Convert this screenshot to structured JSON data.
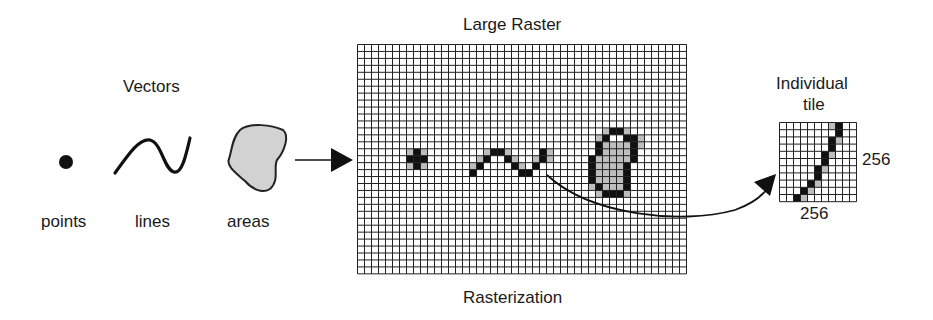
{
  "vectors": {
    "title": "Vectors",
    "items": [
      {
        "label": "points",
        "icon": "point-dot"
      },
      {
        "label": "lines",
        "icon": "wavy-line"
      },
      {
        "label": "areas",
        "icon": "blob-area"
      }
    ]
  },
  "raster": {
    "title": "Large Raster",
    "caption": "Rasterization",
    "columns": 47,
    "rows": 33,
    "black_cells": [
      [
        8,
        15
      ],
      [
        7,
        16
      ],
      [
        8,
        16
      ],
      [
        9,
        16
      ],
      [
        8,
        17
      ],
      [
        16,
        18
      ],
      [
        17,
        17
      ],
      [
        18,
        16
      ],
      [
        19,
        15
      ],
      [
        20,
        15
      ],
      [
        21,
        16
      ],
      [
        22,
        17
      ],
      [
        23,
        18
      ],
      [
        24,
        18
      ],
      [
        25,
        17
      ],
      [
        26,
        16
      ],
      [
        26,
        15
      ],
      [
        36,
        12
      ],
      [
        37,
        12
      ],
      [
        35,
        13
      ],
      [
        38,
        13
      ],
      [
        39,
        13
      ],
      [
        34,
        14
      ],
      [
        39,
        14
      ],
      [
        34,
        15
      ],
      [
        39,
        15
      ],
      [
        33,
        16
      ],
      [
        39,
        16
      ],
      [
        33,
        17
      ],
      [
        38,
        17
      ],
      [
        33,
        18
      ],
      [
        38,
        18
      ],
      [
        33,
        19
      ],
      [
        38,
        19
      ],
      [
        34,
        20
      ],
      [
        38,
        20
      ],
      [
        35,
        21
      ],
      [
        36,
        21
      ],
      [
        37,
        21
      ]
    ],
    "gray_cells": [
      [
        7,
        15
      ],
      [
        9,
        15
      ],
      [
        7,
        17
      ],
      [
        9,
        17
      ],
      [
        16,
        17
      ],
      [
        17,
        16
      ],
      [
        18,
        15
      ],
      [
        21,
        15
      ],
      [
        22,
        16
      ],
      [
        23,
        17
      ],
      [
        25,
        16
      ],
      [
        27,
        15
      ],
      [
        27,
        16
      ],
      [
        35,
        12
      ],
      [
        38,
        12
      ],
      [
        40,
        13
      ],
      [
        40,
        14
      ],
      [
        35,
        14
      ],
      [
        36,
        14
      ],
      [
        37,
        14
      ],
      [
        38,
        14
      ],
      [
        34,
        13
      ],
      [
        35,
        15
      ],
      [
        36,
        15
      ],
      [
        37,
        15
      ],
      [
        38,
        15
      ],
      [
        34,
        16
      ],
      [
        35,
        16
      ],
      [
        36,
        16
      ],
      [
        37,
        16
      ],
      [
        38,
        16
      ],
      [
        34,
        17
      ],
      [
        35,
        17
      ],
      [
        36,
        17
      ],
      [
        37,
        17
      ],
      [
        34,
        18
      ],
      [
        35,
        18
      ],
      [
        36,
        18
      ],
      [
        37,
        18
      ],
      [
        34,
        19
      ],
      [
        35,
        19
      ],
      [
        36,
        19
      ],
      [
        37,
        19
      ],
      [
        35,
        20
      ],
      [
        36,
        20
      ],
      [
        37,
        20
      ],
      [
        33,
        20
      ],
      [
        34,
        21
      ],
      [
        38,
        21
      ]
    ]
  },
  "tile": {
    "title_line1": "Individual",
    "title_line2": "tile",
    "width_label": "256",
    "height_label": "256",
    "columns": 11,
    "rows": 11,
    "black_cells": [
      [
        8,
        0
      ],
      [
        8,
        1
      ],
      [
        7,
        2
      ],
      [
        7,
        3
      ],
      [
        6,
        4
      ],
      [
        6,
        5
      ],
      [
        5,
        6
      ],
      [
        5,
        7
      ],
      [
        4,
        8
      ],
      [
        3,
        9
      ],
      [
        2,
        10
      ]
    ],
    "gray_cells": [
      [
        7,
        0
      ],
      [
        8,
        2
      ],
      [
        7,
        4
      ],
      [
        6,
        6
      ],
      [
        5,
        8
      ],
      [
        4,
        9
      ],
      [
        3,
        10
      ]
    ]
  }
}
